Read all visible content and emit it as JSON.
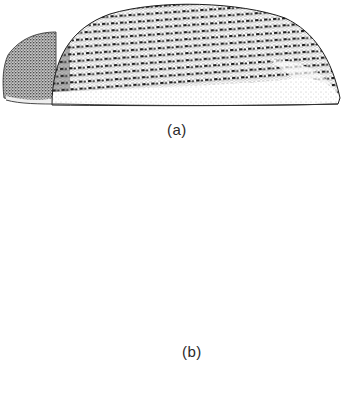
{
  "figure": {
    "panels": [
      {
        "id": "a",
        "label": "(a)",
        "subject": "beetle-lateral-view"
      },
      {
        "id": "b",
        "label": "(b)",
        "subject": "beetle-lateral-view-with-pointer"
      },
      {
        "id": "c",
        "label": "",
        "subject": "partial-structure-outline"
      }
    ]
  },
  "colors": {
    "ink": "#1c1c1c",
    "stipple_dark": "#2e2e2e",
    "stipple_mid": "#6a6a6a",
    "stipple_light": "#b8b8b8",
    "paper": "#ffffff"
  }
}
